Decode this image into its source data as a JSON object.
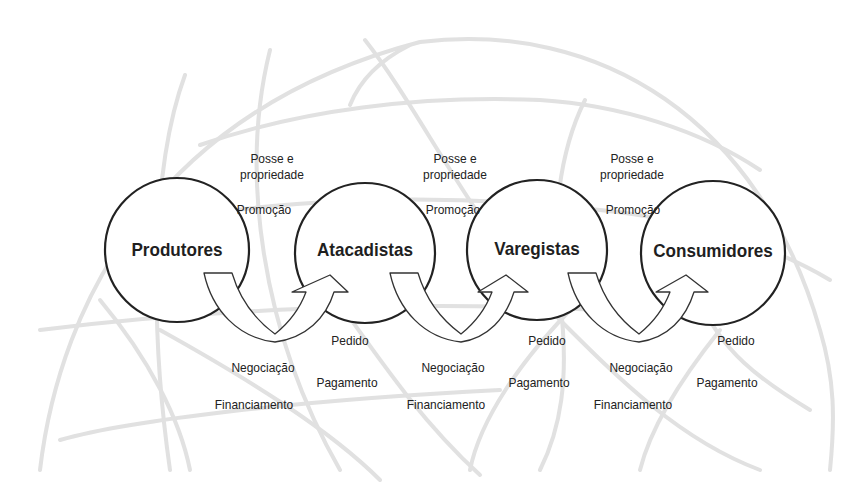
{
  "diagram": {
    "title": "",
    "nodes": [
      {
        "id": "produtores",
        "label": "Produtores",
        "cx": 177,
        "cy": 250,
        "r": 72
      },
      {
        "id": "atacadistas",
        "label": "Atacadistas",
        "cx": 365,
        "cy": 253,
        "r": 70
      },
      {
        "id": "varegistas",
        "label": "Varegistas",
        "cx": 537,
        "cy": 250,
        "r": 70
      },
      {
        "id": "consumidores",
        "label": "Consumidores",
        "cx": 713,
        "cy": 253,
        "r": 72
      }
    ],
    "links": [
      {
        "from": "produtores",
        "to": "atacadistas",
        "forward_flows": [
          "Posse e propriedade",
          "Promoção"
        ],
        "backward_flows": [
          "Pedido",
          "Pagamento"
        ],
        "bidirectional_flows": [
          "Negociação",
          "Financiamento"
        ]
      },
      {
        "from": "atacadistas",
        "to": "varegistas",
        "forward_flows": [
          "Posse e propriedade",
          "Promoção"
        ],
        "backward_flows": [
          "Pedido",
          "Pagamento"
        ],
        "bidirectional_flows": [
          "Negociação",
          "Financiamento"
        ]
      },
      {
        "from": "varegistas",
        "to": "consumidores",
        "forward_flows": [
          "Posse e propriedade",
          "Promoção"
        ],
        "backward_flows": [
          "Pedido",
          "Pagamento"
        ],
        "bidirectional_flows": [
          "Negociação",
          "Financiamento"
        ]
      }
    ],
    "labels": {
      "posse_line1": "Posse e",
      "posse_line2": "propriedade",
      "promocao": "Promoção",
      "pedido": "Pedido",
      "pagamento": "Pagamento",
      "negociacao": "Negociação",
      "financiamento": "Financiamento"
    },
    "background": "faint globe sketch",
    "colors": {
      "stroke": "#222222",
      "globe": "#d9d9d9",
      "background": "#ffffff"
    }
  }
}
